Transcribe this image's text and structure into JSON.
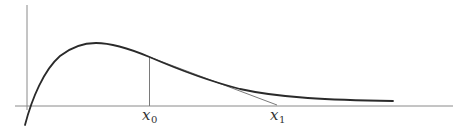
{
  "diagram": {
    "colors": {
      "curve": "#2a2a2a",
      "axes": "#8a8a8a",
      "tangent": "#7a7a7a",
      "vertical": "#7a7a7a",
      "text": "#333333"
    },
    "labels": {
      "x0": {
        "base": "x",
        "sub": "0"
      },
      "x1": {
        "base": "x",
        "sub": "1"
      }
    }
  }
}
